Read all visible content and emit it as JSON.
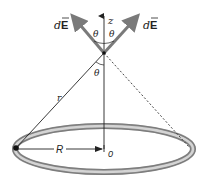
{
  "diagram": {
    "labels": {
      "dE_left": "dE",
      "dE_right": "dE",
      "z_axis": "z",
      "theta_left_top": "θ",
      "theta_right_top": "θ",
      "theta_lower": "θ",
      "r": "r",
      "R": "R",
      "origin": "0"
    },
    "colors": {
      "arrow": "#7a7a7a",
      "ring_outer": "#8c8c8c",
      "ring_highlight": "#d9d9d9",
      "line": "#222222",
      "background": "#ffffff"
    }
  }
}
